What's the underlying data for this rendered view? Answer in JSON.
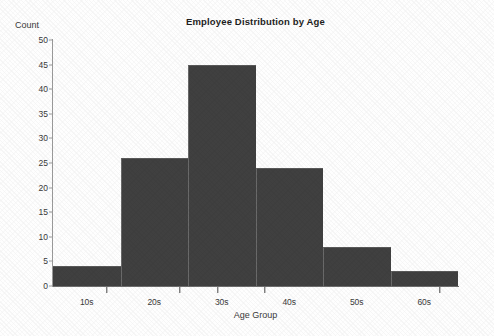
{
  "chart_data": {
    "type": "bar",
    "title": "Employee Distribution by Age",
    "xlabel": "Age Group",
    "ylabel": "Count",
    "categories": [
      "10s",
      "20s",
      "30s",
      "40s",
      "50s",
      "60s"
    ],
    "values": [
      4,
      26,
      45,
      24,
      8,
      3
    ],
    "series": [
      {
        "name": "Count",
        "values": [
          4,
          26,
          45,
          24,
          8,
          3
        ]
      }
    ],
    "ylim": [
      0,
      50
    ],
    "ytick_labels": [
      "0",
      "5",
      "10",
      "15",
      "20",
      "25",
      "30",
      "35",
      "40",
      "45",
      "50"
    ],
    "ytick_values": [
      0,
      5,
      10,
      15,
      20,
      25,
      30,
      35,
      40,
      45,
      50
    ],
    "xtick_labels": [
      "10s",
      "20s",
      "30s",
      "40s",
      "50s",
      "60s"
    ],
    "grid": false,
    "legend": false,
    "legend_position": "none",
    "bar_color": "#404040",
    "axis_color": "#6e6e6e",
    "text_color": "#3a3a3a",
    "background_color": "#ffffff",
    "bar_gap": 0,
    "annotations": []
  }
}
